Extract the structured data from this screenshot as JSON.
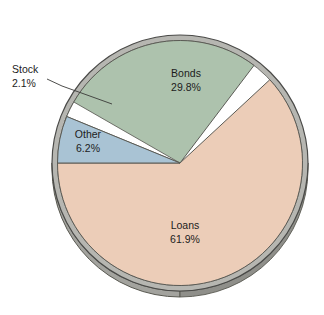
{
  "chart_data": {
    "type": "pie",
    "title": "",
    "subtitle": "",
    "xlabel": "",
    "ylabel": "",
    "legend_position": "none",
    "grid": false,
    "units": "percent",
    "categories": [
      "Loans",
      "Bonds",
      "Other",
      "Stock"
    ],
    "values": [
      61.9,
      29.8,
      6.2,
      2.1
    ],
    "slices": [
      {
        "name": "Loans",
        "label": "Loans",
        "value": 61.9,
        "value_label": "61.9%",
        "color": "#eccdb8",
        "start_angle_deg": 180.0,
        "end_angle_deg": 402.84,
        "label_placement": "inside",
        "label_x": 185,
        "label_y": 232
      },
      {
        "name": "Bonds",
        "label": "Bonds",
        "value": 29.8,
        "value_label": "29.8%",
        "color": "#adc2ad",
        "start_angle_deg": 52.84,
        "end_angle_deg": 160.12,
        "label_placement": "inside",
        "label_x": 186,
        "label_y": 80
      },
      {
        "name": "Other",
        "label": "Other",
        "value": 6.2,
        "value_label": "6.2%",
        "color": "#a9c3d4",
        "start_angle_deg": 157.68,
        "end_angle_deg": 180.0,
        "label_placement": "inside",
        "label_x": 86,
        "label_y": 141
      },
      {
        "name": "Stock",
        "label": "Stock",
        "value": 2.1,
        "value_label": "2.1%",
        "color": "#ffffff",
        "start_angle_deg": 150.12,
        "end_angle_deg": 157.68,
        "label_placement": "callout",
        "label_x": 12,
        "label_y": 70
      }
    ],
    "style": {
      "three_d": true,
      "depth_side_color": "#9a9a96",
      "depth_side_shadow": "#7d7d79",
      "outline_color": "#4a4a48",
      "background": "#ffffff",
      "center_x": 180,
      "center_y": 163,
      "radius": 128
    }
  },
  "callouts": [
    {
      "name": "stock",
      "line1": "Stock",
      "line2": "2.1%"
    }
  ],
  "labels": {
    "loans_name": "Loans",
    "loans_value": "61.9%",
    "bonds_name": "Bonds",
    "bonds_value": "29.8%",
    "other_name": "Other",
    "other_value": "6.2%",
    "stock_name": "Stock",
    "stock_value": "2.1%"
  }
}
